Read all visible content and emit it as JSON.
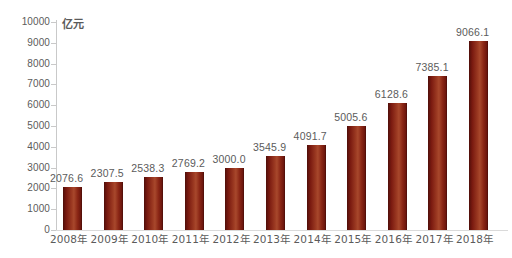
{
  "chart_data": {
    "type": "bar",
    "title": "",
    "subtitle": "",
    "unit_label": "亿元",
    "xlabel": "",
    "ylabel": "",
    "ylim": [
      0,
      10000
    ],
    "ytick_step": 1000,
    "grid": false,
    "legend": null,
    "bar_color": "#8a2615",
    "bar_color_dark": "#5e120c",
    "bar_color_light": "#a8482c",
    "label_color": "#5b5b5b",
    "axis_color": "#c9c9c9",
    "categories": [
      "2008年",
      "2009年",
      "2010年",
      "2011年",
      "2012年",
      "2013年",
      "2014年",
      "2015年",
      "2016年",
      "2017年",
      "2018年"
    ],
    "values": [
      2076.6,
      2307.5,
      2538.3,
      2769.2,
      3000.0,
      3545.9,
      4091.7,
      5005.6,
      6128.6,
      7385.1,
      9066.1
    ],
    "value_labels": [
      "2076.6",
      "2307.5",
      "2538.3",
      "2769.2",
      "3000.0",
      "3545.9",
      "4091.7",
      "5005.6",
      "6128.6",
      "7385.1",
      "9066.1"
    ],
    "ytick_labels": [
      "10000",
      "9000",
      "8000",
      "7000",
      "6000",
      "5000",
      "4000",
      "3000",
      "2000",
      "1000",
      "0"
    ],
    "ytick_values": [
      10000,
      9000,
      8000,
      7000,
      6000,
      5000,
      4000,
      3000,
      2000,
      1000,
      0
    ]
  }
}
